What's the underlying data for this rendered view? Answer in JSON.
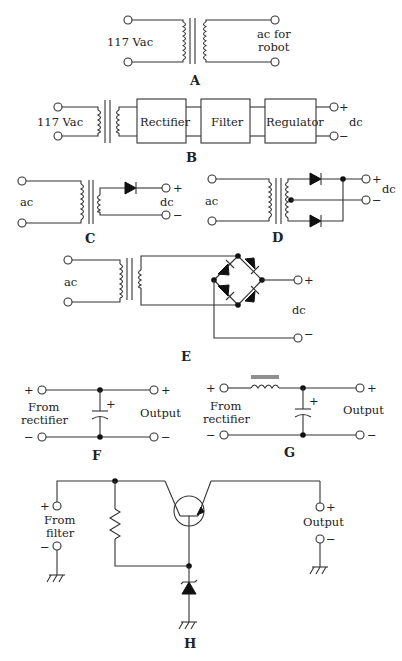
{
  "figure": {
    "panels": {
      "A": {
        "caption": "A",
        "input_label": "117 Vac",
        "output_label_line1": "ac for",
        "output_label_line2": "robot"
      },
      "B": {
        "caption": "B",
        "input_label": "117 Vac",
        "blocks": [
          "Rectifier",
          "Filter",
          "Regulator"
        ],
        "output_label": "dc",
        "plus": "+",
        "minus": "−"
      },
      "C": {
        "caption": "C",
        "input_label": "ac",
        "output_label": "dc",
        "plus": "+",
        "minus": "−"
      },
      "D": {
        "caption": "D",
        "input_label": "ac",
        "output_label": "dc",
        "plus": "+",
        "minus": "−"
      },
      "E": {
        "caption": "E",
        "input_label": "ac",
        "output_label": "dc",
        "plus": "+",
        "minus": "−"
      },
      "F": {
        "caption": "F",
        "input_line1": "From",
        "input_line2": "rectifier",
        "output_label": "Output",
        "plus": "+",
        "minus": "−",
        "cap_polarity": "+"
      },
      "G": {
        "caption": "G",
        "input_line1": "From",
        "input_line2": "rectifier",
        "output_label": "Output",
        "plus": "+",
        "minus": "−",
        "cap_polarity": "+"
      },
      "H": {
        "caption": "H",
        "input_line1": "From",
        "input_line2": "filter",
        "output_label": "Output",
        "plus": "+",
        "minus": "−"
      }
    }
  }
}
